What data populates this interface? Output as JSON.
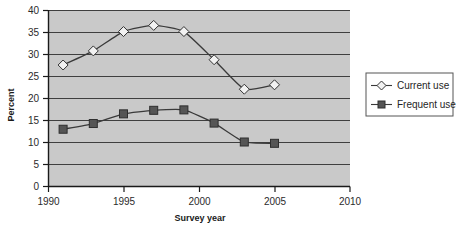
{
  "chart_data": {
    "type": "line",
    "title": "",
    "xlabel": "Survey year",
    "ylabel": "Percent",
    "xlim": [
      1990,
      2010
    ],
    "ylim": [
      0,
      40
    ],
    "xticks": [
      1990,
      1995,
      2000,
      2005,
      2010
    ],
    "yticks": [
      0,
      5,
      10,
      15,
      20,
      25,
      30,
      35,
      40
    ],
    "grid": "horizontal",
    "legend_position": "right",
    "plot_background": "#c9c9c9",
    "line_color": "#3a3a3a",
    "x": [
      1991,
      1993,
      1995,
      1997,
      1999,
      2001,
      2003,
      2005
    ],
    "series": [
      {
        "name": "Current use",
        "marker": "open-diamond",
        "marker_fill": "#f2f2f2",
        "values": [
          27.5,
          30.7,
          35.1,
          36.5,
          35.1,
          28.7,
          22.0,
          23.0
        ]
      },
      {
        "name": "Frequent use",
        "marker": "filled-square",
        "marker_fill": "#555555",
        "values": [
          12.9,
          14.2,
          16.4,
          17.2,
          17.3,
          14.3,
          10.0,
          9.7
        ]
      }
    ]
  },
  "axes": {
    "y_tick_labels": [
      "40",
      "35",
      "30",
      "25",
      "20",
      "15",
      "10",
      "5",
      "0"
    ],
    "x_tick_labels": [
      "1990",
      "1995",
      "2000",
      "2005",
      "2010"
    ],
    "y_axis_title": "Percent",
    "x_axis_title": "Survey year"
  },
  "legend": {
    "items": [
      {
        "label": "Current use",
        "marker": "open-diamond-icon"
      },
      {
        "label": "Frequent use",
        "marker": "filled-square-icon"
      }
    ]
  }
}
